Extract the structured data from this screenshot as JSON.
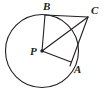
{
  "figure": {
    "background_color": "#ffffff",
    "stroke_color": "#231f20",
    "label_color": "#231f20",
    "canvas": {
      "width": 104,
      "height": 92
    }
  },
  "circle": {
    "name": "circle-P",
    "center_x": 42,
    "center_y": 51,
    "radius": 36.5,
    "stroke_width": 1.1
  },
  "points": [
    {
      "id": "B",
      "label": "B",
      "x": 45,
      "y": 15,
      "label_x": 43,
      "label_y": 1,
      "on_circle": true,
      "dot": false
    },
    {
      "id": "C",
      "label": "C",
      "x": 88,
      "y": 17,
      "label_x": 91,
      "label_y": 5,
      "on_circle": false,
      "dot": false
    },
    {
      "id": "P",
      "label": "P",
      "x": 42,
      "y": 51,
      "label_x": 30,
      "label_y": 46,
      "on_circle": false,
      "dot": true
    },
    {
      "id": "A",
      "label": "A",
      "x": 71,
      "y": 62,
      "label_x": 74,
      "label_y": 64,
      "on_circle": true,
      "dot": false
    }
  ],
  "segments": [
    {
      "id": "PB",
      "from": "P",
      "to": "B",
      "x1": 42,
      "y1": 51,
      "x2": 45,
      "y2": 15
    },
    {
      "id": "PC",
      "from": "P",
      "to": "C",
      "x1": 42,
      "y1": 51,
      "x2": 88,
      "y2": 17
    },
    {
      "id": "PA",
      "from": "P",
      "to": "A",
      "x1": 42,
      "y1": 51,
      "x2": 71,
      "y2": 62
    },
    {
      "id": "BC",
      "from": "B",
      "to": "C",
      "x1": 45,
      "y1": 15,
      "x2": 88,
      "y2": 17
    },
    {
      "id": "CA",
      "from": "C",
      "to": "A",
      "x1": 88,
      "y1": 17,
      "x2": 70,
      "y2": 66
    }
  ],
  "center_dot": {
    "x": 42,
    "y": 51,
    "radius": 1.7
  }
}
